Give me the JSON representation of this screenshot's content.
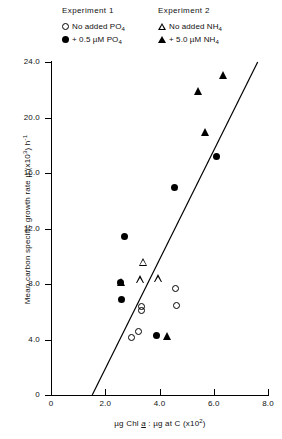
{
  "legend": {
    "columns": [
      {
        "title": "Experiment 1",
        "entries": [
          {
            "marker": "open-circle",
            "label": "No added PO",
            "sub": "4"
          },
          {
            "marker": "filled-circle",
            "label": "+ 0.5 µM PO",
            "sub": "4"
          }
        ]
      },
      {
        "title": "Experiment 2",
        "entries": [
          {
            "marker": "open-triangle",
            "label": "No added NH",
            "sub": "4"
          },
          {
            "marker": "filled-triangle",
            "label": "+ 5.0 µM NH",
            "sub": "4"
          }
        ]
      }
    ]
  },
  "axes": {
    "y_title_main": "Mean carbon specific growth rate µ (x10",
    "y_title_exp": "3",
    "y_title_tail": ") h",
    "y_title_tail_exp": "-1",
    "x_title_pre": "µg Chl ",
    "x_title_ital": "a",
    "x_title_mid": " : µg at C (x10",
    "x_title_exp": "2",
    "x_title_post": ")",
    "y_ticks": [
      "0",
      "4.0",
      "8.0",
      "12.0",
      "16.0",
      "20.0",
      "24.0"
    ],
    "x_ticks": [
      "0",
      "2.0",
      "4.0",
      "6.0",
      "8.0"
    ]
  },
  "chart_data": {
    "type": "scatter",
    "title": "",
    "xlabel": "µg Chl a : µg at C (x10^2)",
    "ylabel": "Mean carbon specific growth rate µ (x10^3) h^-1",
    "xlim": [
      0,
      8.0
    ],
    "ylim": [
      0,
      24.0
    ],
    "xticks": [
      0,
      2.0,
      4.0,
      6.0,
      8.0
    ],
    "yticks": [
      0,
      4.0,
      8.0,
      12.0,
      16.0,
      20.0,
      24.0
    ],
    "grid": false,
    "legend_position": "above-plot",
    "series": [
      {
        "name": "No added PO4",
        "experiment": "Experiment 1",
        "marker": "open-circle",
        "points": [
          {
            "x": 3.35,
            "y": 6.35
          },
          {
            "x": 3.35,
            "y": 6.05
          },
          {
            "x": 4.6,
            "y": 7.65
          },
          {
            "x": 4.65,
            "y": 6.45
          },
          {
            "x": 3.0,
            "y": 4.1
          },
          {
            "x": 3.25,
            "y": 4.55
          }
        ]
      },
      {
        "name": "+ 0.5 µM PO4",
        "experiment": "Experiment 1",
        "marker": "filled-circle",
        "points": [
          {
            "x": 2.7,
            "y": 11.4
          },
          {
            "x": 2.55,
            "y": 8.1
          },
          {
            "x": 2.6,
            "y": 6.9
          },
          {
            "x": 4.55,
            "y": 14.95
          },
          {
            "x": 6.1,
            "y": 17.2
          },
          {
            "x": 3.9,
            "y": 4.3
          }
        ]
      },
      {
        "name": "No added NH4",
        "experiment": "Experiment 2",
        "marker": "open-triangle",
        "points": [
          {
            "x": 3.4,
            "y": 9.6
          },
          {
            "x": 3.3,
            "y": 8.35
          },
          {
            "x": 3.95,
            "y": 8.4
          }
        ]
      },
      {
        "name": "+ 5.0 µM NH4",
        "experiment": "Experiment 2",
        "marker": "filled-triangle",
        "points": [
          {
            "x": 6.35,
            "y": 23.05
          },
          {
            "x": 5.45,
            "y": 21.9
          },
          {
            "x": 5.7,
            "y": 18.95
          },
          {
            "x": 2.6,
            "y": 8.15
          },
          {
            "x": 4.3,
            "y": 4.25
          }
        ]
      }
    ],
    "fit_line": {
      "name": "regression-line",
      "x_start": 1.52,
      "y_start": 0.0,
      "x_end": 7.62,
      "y_end": 24.0
    }
  }
}
